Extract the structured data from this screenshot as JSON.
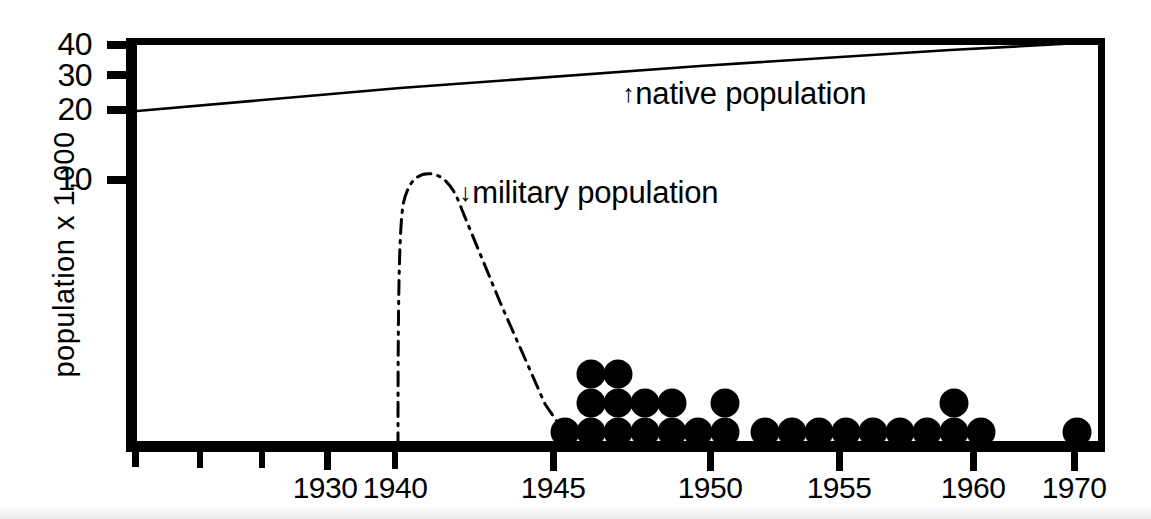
{
  "figure": {
    "title": "",
    "background_color": "#ffffff",
    "ink_color": "#000000"
  },
  "axes": {
    "ylabel": "population x 1,000",
    "ytick_labels": [
      "40",
      "30",
      "20",
      "10"
    ],
    "xtick_labels": [
      "1930",
      "1940",
      "1945",
      "1950",
      "1955",
      "1960",
      "1970"
    ]
  },
  "annotations": {
    "native": {
      "arrow": "↑",
      "text": "native population"
    },
    "military": {
      "arrow": "↓",
      "text": "military population"
    }
  },
  "chart_data": {
    "type": "line",
    "title": "",
    "xlabel": "",
    "ylabel": "population x 1,000",
    "grid": false,
    "legend_position": "inline-annotations",
    "x_axis": {
      "tick_values": [
        1930,
        1940,
        1945,
        1950,
        1955,
        1960,
        1970
      ],
      "tick_labels": [
        "1930",
        "1940",
        "1945",
        "1950",
        "1955",
        "1960",
        "1970"
      ],
      "minor_tick_values": [
        1920,
        1925,
        1935
      ],
      "scale": "piecewise-compressed",
      "range": [
        1918,
        1972
      ]
    },
    "y_axis": {
      "tick_values": [
        10,
        20,
        30,
        40
      ],
      "tick_labels": [
        "10",
        "20",
        "30",
        "40"
      ],
      "scale": "nonlinear-compressed-upper",
      "range": [
        0,
        40
      ],
      "units": "thousands of people"
    },
    "series": [
      {
        "name": "native population",
        "style": "solid-thin-line",
        "points": [
          {
            "x": 1918,
            "y": 20
          },
          {
            "x": 1930,
            "y": 23
          },
          {
            "x": 1940,
            "y": 26
          },
          {
            "x": 1945,
            "y": 29
          },
          {
            "x": 1950,
            "y": 32
          },
          {
            "x": 1955,
            "y": 35
          },
          {
            "x": 1960,
            "y": 37
          },
          {
            "x": 1970,
            "y": 40
          }
        ]
      },
      {
        "name": "military population",
        "style": "dash-dot-line",
        "points": [
          {
            "x": 1940.0,
            "y": 0
          },
          {
            "x": 1940.2,
            "y": 3
          },
          {
            "x": 1940.5,
            "y": 7
          },
          {
            "x": 1941.0,
            "y": 9.6
          },
          {
            "x": 1941.8,
            "y": 10.0
          },
          {
            "x": 1942.4,
            "y": 9.5
          },
          {
            "x": 1943.0,
            "y": 8.0
          },
          {
            "x": 1944.0,
            "y": 5.5
          },
          {
            "x": 1945.0,
            "y": 3.0
          },
          {
            "x": 1945.8,
            "y": 0.8
          },
          {
            "x": 1946.0,
            "y": 0
          }
        ]
      },
      {
        "name": "individual records (dot stacks)",
        "style": "filled-circle-stack",
        "description": "Each filled dot represents one record plotted at its year; dots stack vertically where multiple records share a year.",
        "categories": [
          1945,
          1946,
          1947,
          1948,
          1949,
          1950,
          1951,
          1952,
          1953,
          1954,
          1955,
          1956,
          1957,
          1958,
          1959,
          1960,
          1970
        ],
        "counts": [
          1,
          3,
          3,
          2,
          2,
          1,
          2,
          0,
          1,
          1,
          1,
          1,
          1,
          1,
          1,
          2,
          1,
          1
        ]
      }
    ]
  },
  "dot_stacks": [
    {
      "x": 565,
      "count": 1
    },
    {
      "x": 591,
      "count": 3
    },
    {
      "x": 618,
      "count": 3
    },
    {
      "x": 645,
      "count": 2
    },
    {
      "x": 672,
      "count": 2
    },
    {
      "x": 698,
      "count": 1
    },
    {
      "x": 725,
      "count": 2
    },
    {
      "x": 765,
      "count": 1
    },
    {
      "x": 792,
      "count": 1
    },
    {
      "x": 819,
      "count": 1
    },
    {
      "x": 846,
      "count": 1
    },
    {
      "x": 873,
      "count": 1
    },
    {
      "x": 900,
      "count": 1
    },
    {
      "x": 927,
      "count": 1
    },
    {
      "x": 954,
      "count": 2
    },
    {
      "x": 981,
      "count": 1
    },
    {
      "x": 1077,
      "count": 1
    }
  ]
}
